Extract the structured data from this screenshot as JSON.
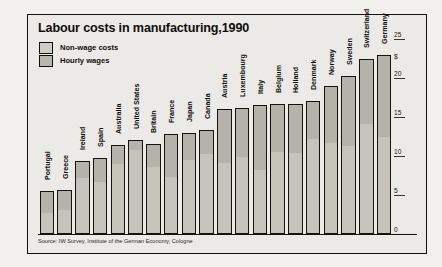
{
  "title": "Labour costs in manufacturing,1990",
  "source": "Source: IW Survey, Institute of the German Economy, Cologne",
  "legend": {
    "items": [
      {
        "label": "Non-wage costs",
        "color": "#b5b2ac"
      },
      {
        "label": "Hourly wages",
        "color": "#c6c3bd"
      }
    ]
  },
  "axis": {
    "currency_symbol": "$",
    "ticks": [
      {
        "value": 25,
        "label": "25"
      },
      {
        "value": 20,
        "label": "20"
      },
      {
        "value": 15,
        "label": "15"
      },
      {
        "value": 10,
        "label": "10"
      },
      {
        "value": 5,
        "label": "5"
      },
      {
        "value": 0,
        "label": "0"
      }
    ]
  },
  "chart_data": {
    "type": "bar",
    "title": "Labour costs in manufacturing,1990",
    "subtitle": "",
    "xlabel": "",
    "ylabel": "$",
    "ylim": [
      0,
      25
    ],
    "grid": false,
    "stacked": true,
    "legend_position": "top-left",
    "categories": [
      "Portugal",
      "Greece",
      "Ireland",
      "Spain",
      "Australia",
      "United States",
      "Britain",
      "France",
      "Japan",
      "Canada",
      "Austria",
      "Luxembourg",
      "Italy",
      "Belgium",
      "Holland",
      "Denmark",
      "Norway",
      "Sweden",
      "Switzerland",
      "Germany"
    ],
    "series": [
      {
        "name": "Hourly wages",
        "values": [
          2.6,
          2.9,
          7.0,
          6.5,
          8.8,
          10.6,
          8.4,
          7.2,
          9.3,
          10.1,
          9.0,
          9.7,
          8.1,
          10.4,
          10.2,
          12.0,
          11.5,
          11.1,
          14.0,
          12.3
        ]
      },
      {
        "name": "Non-wage costs",
        "values": [
          2.9,
          2.7,
          2.4,
          3.2,
          2.6,
          1.5,
          3.1,
          5.6,
          3.7,
          3.2,
          7.0,
          6.5,
          8.4,
          6.3,
          6.5,
          5.0,
          7.5,
          9.2,
          8.5,
          10.7
        ]
      }
    ],
    "totals": [
      5.5,
      5.6,
      9.4,
      9.7,
      11.4,
      12.1,
      11.5,
      12.8,
      13.0,
      13.3,
      16.0,
      16.2,
      16.5,
      16.7,
      16.7,
      17.0,
      19.0,
      20.3,
      22.5,
      23.0
    ]
  }
}
